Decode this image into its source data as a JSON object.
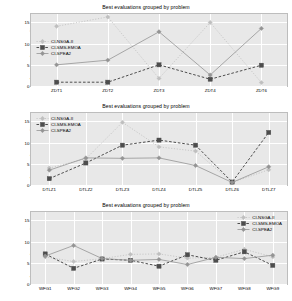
{
  "figure": {
    "ylabel": "Average performance ranking",
    "yticks": [
      "15",
      "10",
      "5",
      "0"
    ]
  },
  "series_names": {
    "nsga": "CI-NSGA-II",
    "sms": "CI-SMS-EMOA",
    "spea": "CI-SPEA2"
  },
  "colors": {
    "nsga": "#bfbfbf",
    "sms": "#4d4d4d",
    "spea": "#949494",
    "plot_background": "#e8e8e8",
    "grid": "#ffffff",
    "text": "#000000"
  },
  "chart_data": [
    {
      "type": "line",
      "title": "Best evaluations grouped by problem",
      "xlabel": "",
      "ylabel": "Average performance ranking",
      "categories": [
        "ZDT1",
        "ZDT2",
        "ZDT3",
        "ZDT4",
        "ZDT6"
      ],
      "ylim": [
        0,
        17
      ],
      "yticks": [
        0,
        5,
        10,
        15
      ],
      "grid": true,
      "legend_position": "left",
      "series": [
        {
          "name": "CI-NSGA-II",
          "values": [
            14.1,
            16.3,
            1.8,
            15.0,
            0.8
          ]
        },
        {
          "name": "CI-SMS-EMOA",
          "values": [
            0.9,
            0.9,
            5.0,
            1.6,
            4.9
          ]
        },
        {
          "name": "CI-SPEA2",
          "values": [
            5.0,
            6.1,
            12.8,
            2.6,
            13.6
          ]
        }
      ]
    },
    {
      "type": "line",
      "title": "Best evaluations grouped by problem",
      "xlabel": "",
      "ylabel": "Average performance ranking",
      "categories": [
        "DTLZ1",
        "DTLZ2",
        "DTLZ3",
        "DTLZ4",
        "DTLZ5",
        "DTLZ6",
        "DTLZ7"
      ],
      "ylim": [
        0,
        17
      ],
      "yticks": [
        0,
        5,
        10,
        15
      ],
      "grid": true,
      "legend_position": "left",
      "series": [
        {
          "name": "CI-NSGA-II",
          "values": [
            4.0,
            6.2,
            14.8,
            9.0,
            8.0,
            0.6,
            3.6
          ]
        },
        {
          "name": "CI-SMS-EMOA",
          "values": [
            1.5,
            5.2,
            9.4,
            10.6,
            9.4,
            0.7,
            12.4
          ]
        },
        {
          "name": "CI-SPEA2",
          "values": [
            3.5,
            6.4,
            6.3,
            6.4,
            4.6,
            0.6,
            4.3
          ]
        }
      ]
    },
    {
      "type": "line",
      "title": "Best evaluations grouped by problem",
      "xlabel": "",
      "ylabel": "Average performance ranking",
      "categories": [
        "WFG1",
        "WFG2",
        "WFG3",
        "WFG4",
        "WFG5",
        "WFG6",
        "WFG7",
        "WFG8",
        "WFG9"
      ],
      "ylim": [
        0,
        17
      ],
      "yticks": [
        0,
        5,
        10,
        15
      ],
      "grid": true,
      "legend_position": "right",
      "series": [
        {
          "name": "CI-NSGA-II",
          "values": [
            6.4,
            5.3,
            6.0,
            7.0,
            7.1,
            6.1,
            6.3,
            8.2,
            6.4
          ]
        },
        {
          "name": "CI-SMS-EMOA",
          "values": [
            7.1,
            3.7,
            5.9,
            5.6,
            4.2,
            6.9,
            5.6,
            7.6,
            4.4
          ]
        },
        {
          "name": "CI-SPEA2",
          "values": [
            6.6,
            9.1,
            6.0,
            5.6,
            5.8,
            4.6,
            6.3,
            6.0,
            6.8
          ]
        }
      ]
    }
  ]
}
